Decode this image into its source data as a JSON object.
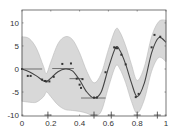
{
  "chart_data": {
    "type": "line",
    "title": "",
    "xlabel": "",
    "ylabel": "",
    "xlim": [
      0,
      1
    ],
    "ylim": [
      -10.2,
      12.8
    ],
    "grid": false,
    "legend": null,
    "x_ticks": [
      0,
      0.2,
      0.4,
      0.6,
      0.8,
      1
    ],
    "x_tick_labels": [
      "0",
      "0.2",
      "0.4",
      "0.6",
      "0.8",
      "1"
    ],
    "y_ticks": [
      10,
      5,
      0,
      -5,
      -10
    ],
    "y_tick_labels": [
      "10",
      "5",
      "0",
      "-5",
      "-10"
    ],
    "series": [
      {
        "name": "mean",
        "kind": "line",
        "color": "#444444",
        "x": [
          0,
          0.05,
          0.1,
          0.15,
          0.17,
          0.2,
          0.25,
          0.3,
          0.35,
          0.4,
          0.45,
          0.5,
          0.55,
          0.6,
          0.65,
          0.68,
          0.72,
          0.76,
          0.8,
          0.85,
          0.9,
          0.95,
          1.0
        ],
        "y": [
          0,
          -0.6,
          -1.5,
          -2.6,
          -2.7,
          -2.0,
          -0.6,
          0,
          -0.4,
          -2.4,
          -5.0,
          -6.3,
          -5.0,
          0.2,
          4.6,
          4.0,
          1.0,
          -3.0,
          -6.0,
          -3.0,
          3.5,
          6.8,
          5.8
        ]
      },
      {
        "name": "confidence band",
        "kind": "area",
        "color": "#d8d8d8",
        "x": [
          0,
          0.05,
          0.1,
          0.15,
          0.17,
          0.2,
          0.25,
          0.3,
          0.35,
          0.4,
          0.45,
          0.5,
          0.55,
          0.6,
          0.65,
          0.68,
          0.72,
          0.76,
          0.8,
          0.85,
          0.9,
          0.95,
          1.0
        ],
        "upper": [
          7,
          6.6,
          4.5,
          0.5,
          -1.0,
          1.5,
          5.5,
          7,
          6.4,
          3.5,
          -0.5,
          -3.0,
          -1.0,
          4.2,
          8.6,
          8.0,
          5.0,
          1.0,
          -2.5,
          0.5,
          7.0,
          10.3,
          10.6
        ],
        "lower": [
          -7,
          -7.2,
          -7.2,
          -6.0,
          -5.0,
          -6.0,
          -7.8,
          -8.8,
          -9.0,
          -9.2,
          -9.6,
          -10.2,
          -9.2,
          -4.0,
          0.6,
          0,
          -3.0,
          -7.0,
          -9.6,
          -6.6,
          -0.5,
          2.5,
          1.6
        ]
      },
      {
        "name": "observations",
        "kind": "scatter",
        "color": "#333333",
        "x": [
          0,
          0.04,
          0.06,
          0.14,
          0.16,
          0.17,
          0.19,
          0.22,
          0.28,
          0.34,
          0.38,
          0.4,
          0.41,
          0.42,
          0.5,
          0.52,
          0.58,
          0.64,
          0.65,
          0.66,
          0.69,
          0.72,
          0.79,
          0.81,
          0.9,
          0.92,
          0.96
        ],
        "y": [
          0,
          -1.5,
          -1.5,
          -2.3,
          -2.6,
          -2.7,
          -2.7,
          -1.7,
          1.1,
          1.2,
          -2.1,
          -3.4,
          -4.1,
          -2.2,
          -6.2,
          -6.2,
          -0.7,
          4.7,
          4.6,
          4.5,
          3.1,
          1.0,
          -6.1,
          -5.4,
          4.7,
          7.4,
          7.0
        ]
      },
      {
        "name": "input error bars",
        "kind": "hbar",
        "color": "#555555",
        "segments": [
          {
            "x0": 0.0,
            "x1": 0.14,
            "y": 0
          },
          {
            "x0": 0.21,
            "x1": 0.36,
            "y": 0.1
          },
          {
            "x0": 0.33,
            "x1": 0.42,
            "y": -2.1
          },
          {
            "x0": 0.41,
            "x1": 0.58,
            "y": -6.3
          }
        ]
      },
      {
        "name": "inducing inputs",
        "kind": "plus-markers",
        "color": "#333333",
        "x": [
          0.18,
          0.5,
          0.62,
          0.8,
          0.94
        ],
        "y": [
          -10,
          -10,
          -10,
          -10,
          -10
        ]
      }
    ]
  }
}
